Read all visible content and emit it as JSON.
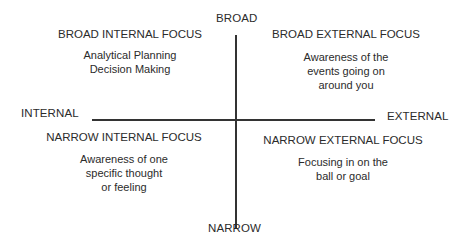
{
  "axes": {
    "top": "BROAD",
    "bottom": "NARROW",
    "left": "INTERNAL",
    "right": "EXTERNAL",
    "line_color": "#333333"
  },
  "quadrants": {
    "top_left": {
      "title": "BROAD INTERNAL FOCUS",
      "lines": [
        "Analytical Planning",
        "Decision Making"
      ]
    },
    "top_right": {
      "title": "BROAD EXTERNAL FOCUS",
      "lines": [
        "Awareness of the",
        "events going on",
        "around you"
      ]
    },
    "bottom_left": {
      "title": "NARROW INTERNAL FOCUS",
      "lines": [
        "Awareness of one",
        "specific thought",
        "or feeling"
      ]
    },
    "bottom_right": {
      "title": "NARROW EXTERNAL FOCUS",
      "lines": [
        "Focusing in on the",
        "ball or goal"
      ]
    }
  }
}
